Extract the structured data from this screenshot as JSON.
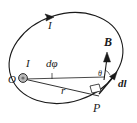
{
  "figure": {
    "background_color": "#ffffff",
    "stroke_color": "#1a1a1a",
    "width": 137,
    "height": 123
  },
  "labels": {
    "current_top": "I",
    "current_center": "I",
    "origin": "O",
    "d_phi": "dφ",
    "radius": "r",
    "field_vector": "B",
    "angle": "θ",
    "element_vector": "d",
    "element_vector_sub": "l",
    "point": "P"
  },
  "elements": {
    "loop": "tilted-current-loop-ellipse",
    "current_arrow": "current-direction-arrowhead",
    "center_dot": "loop-center-source-dot",
    "radius_line": "radius-from-O-to-P",
    "phi_line": "horizontal-reference-line",
    "b_arrow": "magnetic-field-vector-arrow",
    "dl_arrow": "line-element-vector-arrow",
    "right_angle": "right-angle-marker"
  },
  "colors": {
    "ink": "#1a1a1a",
    "fill_light": "#b9b9b9",
    "paper": "#ffffff"
  }
}
